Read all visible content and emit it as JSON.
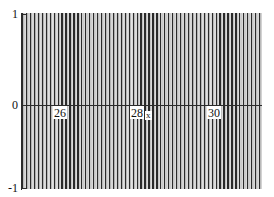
{
  "plot": {
    "background_color": "#ffffff",
    "curve_color": "#2b2b2b",
    "axis_color": "#2b2b2b",
    "axis_labels": {
      "x": "x"
    },
    "y_ticks": [
      {
        "label": "1",
        "value": 1
      },
      {
        "label": "0",
        "value": 0
      },
      {
        "label": "-1",
        "value": -1
      }
    ],
    "x_ticks": [
      {
        "label": "26",
        "value": 26
      },
      {
        "label": "28",
        "value": 28
      },
      {
        "label": "30",
        "value": 30
      }
    ]
  },
  "chart_data": {
    "type": "line",
    "title": "",
    "xlabel": "x",
    "ylabel": "",
    "xlim": [
      25.35,
      31.15
    ],
    "ylim": [
      -1,
      1
    ],
    "grid": false,
    "legend": null,
    "x_tick_values": [
      26,
      28,
      30
    ],
    "x_tick_labels": [
      "26",
      "28",
      "30"
    ],
    "y_tick_values": [
      -1,
      0,
      1
    ],
    "y_tick_labels": [
      "-1",
      "0",
      "1"
    ],
    "series": [
      {
        "name": "sin(k x)",
        "envelope_min": -1,
        "envelope_max": 1,
        "apparent_period_px": 3.95,
        "stroke_color": "#2b2b2b",
        "sampled_x": [
          25.35,
          26,
          27,
          28,
          29,
          30,
          31.15
        ],
        "sampled_amplitude": [
          1,
          1,
          1,
          1,
          1,
          1,
          1
        ]
      }
    ]
  }
}
